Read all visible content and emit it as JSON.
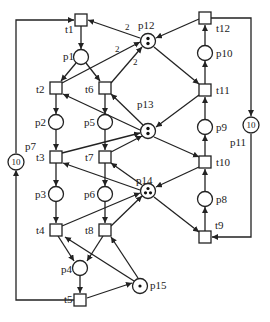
{
  "diagram": {
    "type": "petri-net",
    "colors": {
      "stroke": "#222222",
      "background": "#ffffff"
    },
    "places": [
      {
        "id": "p1",
        "label": "p1",
        "x": 81,
        "y": 57,
        "tokens": 0
      },
      {
        "id": "p2",
        "label": "p2",
        "x": 56,
        "y": 122,
        "tokens": 0
      },
      {
        "id": "p3",
        "label": "p3",
        "x": 56,
        "y": 194,
        "tokens": 0
      },
      {
        "id": "p4",
        "label": "p4",
        "x": 80,
        "y": 268,
        "tokens": 0
      },
      {
        "id": "p5",
        "label": "p5",
        "x": 105,
        "y": 122,
        "tokens": 0
      },
      {
        "id": "p6",
        "label": "p6",
        "x": 105,
        "y": 194,
        "tokens": 0
      },
      {
        "id": "p7",
        "label": "p7",
        "x": 16,
        "y": 162,
        "tokens_text": "10"
      },
      {
        "id": "p8",
        "label": "p8",
        "x": 205,
        "y": 199,
        "tokens": 0
      },
      {
        "id": "p9",
        "label": "p9",
        "x": 205,
        "y": 127,
        "tokens": 0
      },
      {
        "id": "p10",
        "label": "p10",
        "x": 205,
        "y": 53,
        "tokens": 0
      },
      {
        "id": "p11",
        "label": "p11",
        "x": 251,
        "y": 125,
        "tokens_text": "10"
      },
      {
        "id": "p12",
        "label": "p12",
        "x": 148,
        "y": 41,
        "tokens": 2
      },
      {
        "id": "p13",
        "label": "p13",
        "x": 148,
        "y": 131,
        "tokens": 2
      },
      {
        "id": "p14",
        "label": "p14",
        "x": 148,
        "y": 191,
        "tokens": 3
      },
      {
        "id": "p15",
        "label": "p15",
        "x": 140,
        "y": 286,
        "tokens": 1
      }
    ],
    "transitions": [
      {
        "id": "t1",
        "label": "t1",
        "x": 81,
        "y": 20
      },
      {
        "id": "t2",
        "label": "t2",
        "x": 56,
        "y": 88
      },
      {
        "id": "t3",
        "label": "t3",
        "x": 56,
        "y": 157
      },
      {
        "id": "t4",
        "label": "t4",
        "x": 56,
        "y": 230
      },
      {
        "id": "t5",
        "label": "t5",
        "x": 80,
        "y": 300
      },
      {
        "id": "t6",
        "label": "t6",
        "x": 105,
        "y": 88
      },
      {
        "id": "t7",
        "label": "t7",
        "x": 105,
        "y": 157
      },
      {
        "id": "t8",
        "label": "t8",
        "x": 105,
        "y": 230
      },
      {
        "id": "t9",
        "label": "t9",
        "x": 205,
        "y": 237
      },
      {
        "id": "t10",
        "label": "t10",
        "x": 205,
        "y": 162
      },
      {
        "id": "t11",
        "label": "t11",
        "x": 205,
        "y": 90
      },
      {
        "id": "t12",
        "label": "t12",
        "x": 205,
        "y": 18
      }
    ],
    "arc_weights": [
      {
        "from": "p12",
        "to": "t1",
        "weight": "2"
      },
      {
        "from": "t2",
        "to": "p12",
        "weight": "2"
      },
      {
        "from": "t6",
        "to": "p12",
        "weight": "2"
      }
    ]
  }
}
